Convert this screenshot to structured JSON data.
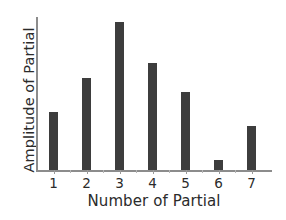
{
  "chart_data": {
    "type": "bar",
    "title": "",
    "xlabel": "Number of Partial",
    "ylabel": "Amplitude of Partial",
    "categories": [
      "1",
      "2",
      "3",
      "4",
      "5",
      "6",
      "7"
    ],
    "values": [
      0.39,
      0.62,
      1.0,
      0.72,
      0.53,
      0.07,
      0.3
    ],
    "ylim": [
      0,
      1.0
    ],
    "xlim": [
      0.4,
      7.6
    ],
    "grid": false,
    "legend": null,
    "bar_color": "#3d3d3d",
    "axis_color": "#8c8c8c",
    "text_color": "#2b2b2b",
    "y_tick_labels": [],
    "annotations": []
  },
  "axes": {
    "x_tick_labels": [
      "1",
      "2",
      "3",
      "4",
      "5",
      "6",
      "7"
    ]
  }
}
